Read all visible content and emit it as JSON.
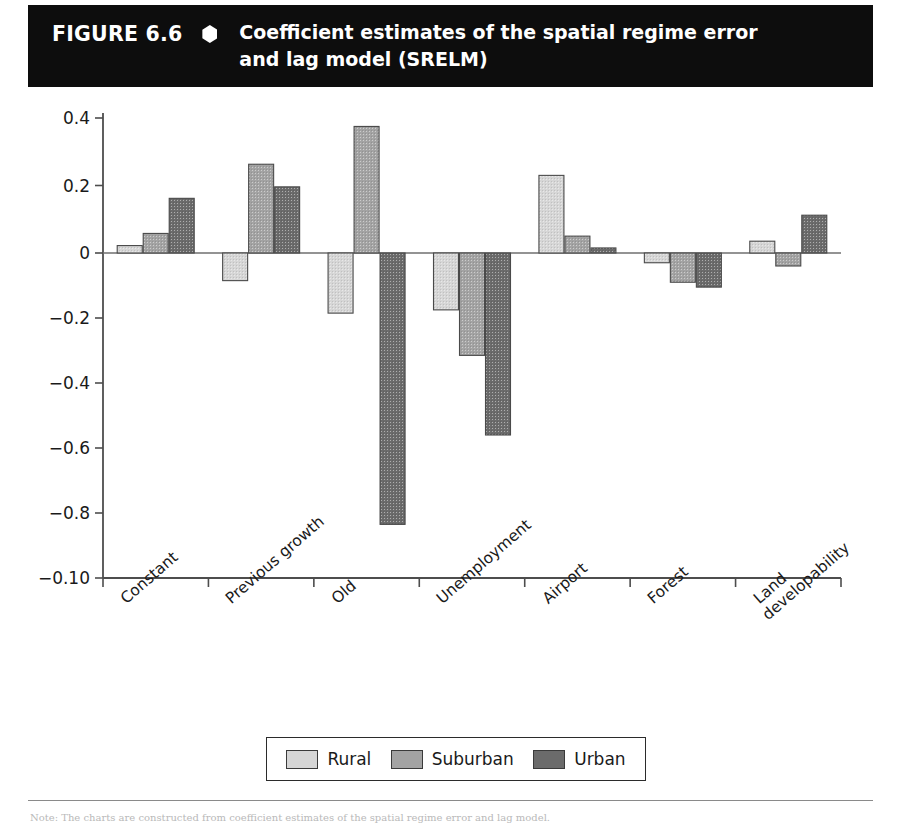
{
  "header": {
    "figure_number": "FIGURE 6.6",
    "bullet_icon": "hexagon-bullet-icon",
    "title_line1": "Coefficient estimates of the spatial regime error",
    "title_line2": "and lag model (SRELM)",
    "background_color": "#0d0d0d",
    "text_color": "#ffffff"
  },
  "footer": {
    "note": "Note: The charts are constructed from coefficient estimates of the spatial regime error and lag model."
  },
  "legend": {
    "position": "bottom-center",
    "entries": [
      {
        "label": "Rural",
        "color": "#d6d6d6"
      },
      {
        "label": "Suburban",
        "color": "#a3a3a3"
      },
      {
        "label": "Urban",
        "color": "#6b6b6b"
      }
    ]
  },
  "chart_data": {
    "type": "bar",
    "title": "Coefficient estimates of the spatial regime error and lag model (SRELM)",
    "xlabel": "",
    "ylabel": "",
    "grid": false,
    "legend_position": "bottom-center",
    "categories": [
      "Constant",
      "Previous growth",
      "Old",
      "Unemployment",
      "Airport",
      "Forest",
      "Land developability"
    ],
    "category_label_lines": [
      [
        "Constant"
      ],
      [
        "Previous growth"
      ],
      [
        "Old"
      ],
      [
        "Unemployment"
      ],
      [
        "Airport"
      ],
      [
        "Forest"
      ],
      [
        "Land",
        "developability"
      ]
    ],
    "series": [
      {
        "name": "Rural",
        "color": "#d6d6d6",
        "values": [
          0.022,
          -0.085,
          -0.185,
          -0.175,
          0.23,
          -0.03,
          0.035
        ]
      },
      {
        "name": "Suburban",
        "color": "#a3a3a3",
        "values": [
          0.058,
          0.263,
          0.375,
          -0.315,
          0.05,
          -0.09,
          -0.04
        ]
      },
      {
        "name": "Urban",
        "color": "#6b6b6b",
        "values": [
          0.162,
          0.196,
          -0.835,
          -0.56,
          0.015,
          -0.105,
          0.112
        ]
      }
    ],
    "yticks": [
      0.4,
      0.2,
      0,
      -0.2,
      -0.4,
      -0.6,
      -0.8,
      -1.0
    ],
    "ytick_labels": [
      "0.4",
      "0.2",
      "0",
      "−0.2",
      "−0.4",
      "−0.6",
      "−0.8",
      "−0.10"
    ],
    "ylim": [
      -1.0,
      0.4
    ],
    "zero_line": 0
  }
}
